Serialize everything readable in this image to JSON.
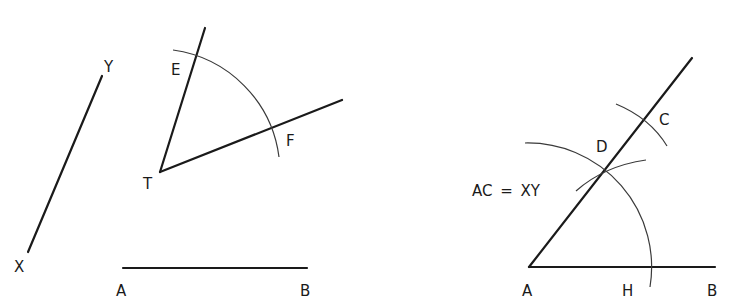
{
  "figure": {
    "left": {
      "segment_xy": {
        "start_label": "X",
        "end_label": "Y"
      },
      "angle": {
        "vertex_label": "T",
        "ray1_point_label": "E",
        "ray2_point_label": "F"
      },
      "segment_ab": {
        "start_label": "A",
        "end_label": "B"
      }
    },
    "right": {
      "base": {
        "start_label": "A",
        "mid_label": "H",
        "end_label": "B"
      },
      "ray_points": {
        "d_label": "D",
        "c_label": "C"
      },
      "equation": "AC = XY"
    }
  },
  "colors": {
    "ink": "#1a1a1a",
    "arc": "#3a3a3a",
    "background": "#ffffff"
  }
}
